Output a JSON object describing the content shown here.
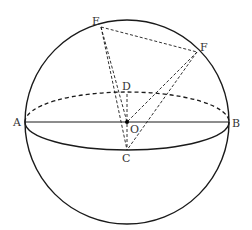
{
  "diagram": {
    "type": "sphere-geometry",
    "colors": {
      "stroke": "#1a1a1a",
      "label": "#333333",
      "background": "#ffffff"
    },
    "points": {
      "A": {
        "label": "A",
        "x": 25,
        "y": 122
      },
      "B": {
        "label": "B",
        "x": 229,
        "y": 122
      },
      "O": {
        "label": "O",
        "x": 127,
        "y": 122
      },
      "C": {
        "label": "C",
        "x": 127,
        "y": 150
      },
      "D": {
        "label": "D",
        "x": 127,
        "y": 94
      },
      "E": {
        "label": "E",
        "x": 101,
        "y": 27
      },
      "F": {
        "label": "F",
        "x": 197,
        "y": 52
      }
    },
    "labels": {
      "A": "A",
      "B": "B",
      "O": "O",
      "C": "C",
      "D": "D",
      "E": "E",
      "F": "F"
    },
    "segments": [
      {
        "from": "A",
        "to": "B",
        "style": "solid"
      },
      {
        "from": "E",
        "to": "F",
        "style": "dashed"
      },
      {
        "from": "E",
        "to": "O",
        "style": "dashed"
      },
      {
        "from": "E",
        "to": "C",
        "style": "dashed"
      },
      {
        "from": "F",
        "to": "O",
        "style": "dashed"
      },
      {
        "from": "F",
        "to": "C",
        "style": "dashed"
      },
      {
        "from": "D",
        "to": "C",
        "style": "dashed"
      }
    ],
    "sphere": {
      "cx": 127,
      "cy": 122,
      "r": 102
    },
    "equator": {
      "cx": 127,
      "cy": 122,
      "rx": 102,
      "ry": 30,
      "front": "solid",
      "back": "dashed"
    }
  }
}
